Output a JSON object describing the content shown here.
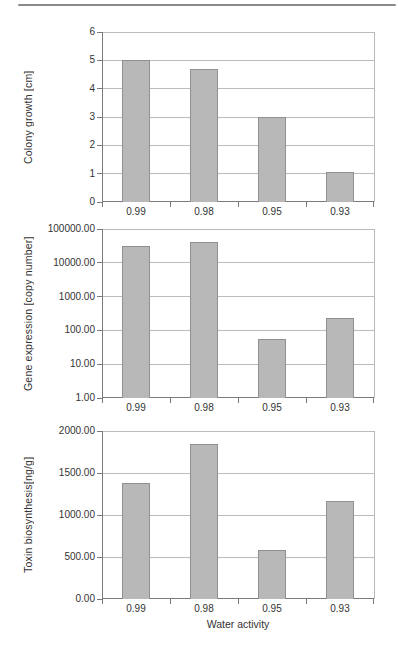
{
  "figure": {
    "x_axis_title": "Water activity",
    "colors": {
      "bar_fill": "#b8b8b8",
      "bar_border": "#909090",
      "gridline": "#bcbcbc",
      "axis": "#7a7a7a",
      "text": "#333333"
    }
  },
  "chart_data": [
    {
      "type": "bar",
      "ylabel": "Colony growth [cm]",
      "xlabel": "",
      "scale": "linear",
      "ylim": [
        0,
        6
      ],
      "grid": true,
      "legend": false,
      "yticks": [
        {
          "value": 0,
          "label": "0"
        },
        {
          "value": 1,
          "label": "1"
        },
        {
          "value": 2,
          "label": "2"
        },
        {
          "value": 3,
          "label": "3"
        },
        {
          "value": 4,
          "label": "4"
        },
        {
          "value": 5,
          "label": "5"
        },
        {
          "value": 6,
          "label": "6"
        }
      ],
      "categories": [
        "0.99",
        "0.98",
        "0.95",
        "0.93"
      ],
      "values": [
        5.0,
        4.7,
        3.0,
        1.05
      ]
    },
    {
      "type": "bar",
      "ylabel": "Gene expression [copy number]",
      "xlabel": "",
      "scale": "log",
      "ylim": [
        1,
        100000
      ],
      "grid": true,
      "legend": false,
      "yticks": [
        {
          "value": 1,
          "label": "1.00"
        },
        {
          "value": 10,
          "label": "10.00"
        },
        {
          "value": 100,
          "label": "100.00"
        },
        {
          "value": 1000,
          "label": "1000.00"
        },
        {
          "value": 10000,
          "label": "10000.00"
        },
        {
          "value": 100000,
          "label": "100000.00"
        }
      ],
      "categories": [
        "0.99",
        "0.98",
        "0.95",
        "0.93"
      ],
      "values": [
        31000,
        40000,
        55,
        240
      ]
    },
    {
      "type": "bar",
      "ylabel": "Toxin biosynthesis[ng/g]",
      "xlabel": "Water activity",
      "scale": "linear",
      "ylim": [
        0,
        2000
      ],
      "grid": true,
      "legend": false,
      "yticks": [
        {
          "value": 0,
          "label": "0.00"
        },
        {
          "value": 500,
          "label": "500.00"
        },
        {
          "value": 1000,
          "label": "1000.00"
        },
        {
          "value": 1500,
          "label": "1500.00"
        },
        {
          "value": 2000,
          "label": "2000.00"
        }
      ],
      "categories": [
        "0.99",
        "0.98",
        "0.95",
        "0.93"
      ],
      "values": [
        1380,
        1850,
        580,
        1170
      ]
    }
  ]
}
